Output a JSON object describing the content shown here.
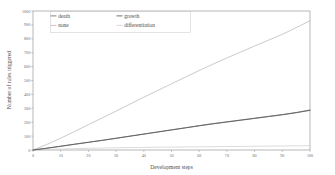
{
  "chart_data": {
    "type": "line",
    "title": "",
    "xlabel": "Development steps",
    "ylabel": "Number of rules triggered",
    "xlim": [
      0,
      100
    ],
    "ylim": [
      0,
      1000
    ],
    "xticks": [
      0,
      10,
      20,
      30,
      40,
      50,
      60,
      70,
      80,
      90,
      100
    ],
    "xticklabels": [
      "0",
      "10",
      "20",
      "30",
      "40",
      "50",
      "60",
      "70",
      "80",
      "90",
      "100"
    ],
    "yticks": [
      0,
      100,
      200,
      300,
      400,
      500,
      600,
      700,
      800,
      900,
      1000
    ],
    "yticklabels": [
      "0",
      "100",
      "200",
      "300",
      "400",
      "500",
      "600",
      "700",
      "800",
      "900",
      "1000"
    ],
    "grid": false,
    "legend_position": "upper-left",
    "x": [
      0,
      5,
      10,
      15,
      20,
      25,
      30,
      35,
      40,
      45,
      50,
      55,
      60,
      65,
      70,
      75,
      80,
      85,
      90,
      95,
      100
    ],
    "series": [
      {
        "name": "death",
        "color": "#6e6e6e",
        "values": [
          0,
          13,
          27,
          42,
          56,
          70,
          85,
          100,
          115,
          130,
          145,
          160,
          175,
          190,
          203,
          216,
          229,
          242,
          255,
          270,
          288
        ]
      },
      {
        "name": "growth",
        "color": "#585858",
        "values": [
          0,
          13,
          27,
          41,
          55,
          69,
          84,
          99,
          114,
          129,
          144,
          159,
          174,
          188,
          201,
          214,
          227,
          240,
          253,
          268,
          285
        ]
      },
      {
        "name": "none",
        "color": "#bdbdbd",
        "values": [
          0,
          40,
          85,
          133,
          182,
          231,
          280,
          330,
          380,
          428,
          476,
          524,
          572,
          618,
          662,
          705,
          748,
          790,
          832,
          880,
          930
        ]
      },
      {
        "name": "differentiation",
        "color": "#d2d2d2",
        "values": [
          0,
          4,
          7,
          10,
          12,
          14,
          16,
          17,
          19,
          20,
          21,
          22,
          23,
          24,
          25,
          26,
          27,
          28,
          29,
          30,
          31
        ]
      }
    ]
  },
  "legend": {
    "entries": [
      {
        "label": "death"
      },
      {
        "label": "growth"
      },
      {
        "label": "none"
      },
      {
        "label": "differentiation"
      }
    ]
  }
}
